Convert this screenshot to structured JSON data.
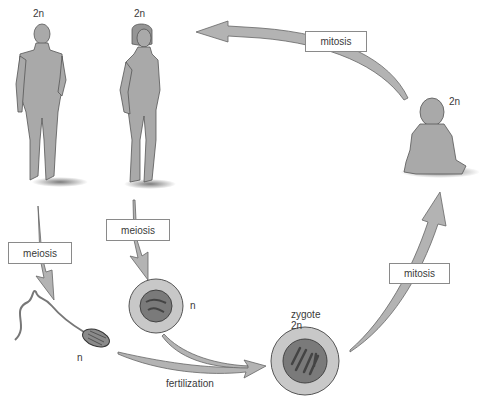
{
  "diagram": {
    "type": "human life cycle",
    "colors": {
      "figure_fill": "#a9a9a9",
      "arrow_fill": "#b3b3b3",
      "outline": "#555555",
      "nucleus": "#707070",
      "label_text": "#3a3a3a",
      "background": "#ffffff"
    },
    "nodes": {
      "male": {
        "label": "2n",
        "description": "adult male"
      },
      "female": {
        "label": "2n",
        "description": "adult female"
      },
      "baby": {
        "label": "2n",
        "description": "infant"
      },
      "sperm": {
        "label": "n",
        "description": "sperm cell"
      },
      "egg": {
        "label": "n",
        "description": "egg cell"
      },
      "zygote": {
        "label_line1": "zygote",
        "label_line2": "2n"
      }
    },
    "processes": {
      "mitosis_top": "mitosis",
      "mitosis_right": "mitosis",
      "meiosis_male": "meiosis",
      "meiosis_female": "meiosis",
      "fertilization": "fertilization"
    },
    "edges": [
      {
        "from": "male",
        "to": "sperm",
        "label": "meiosis"
      },
      {
        "from": "female",
        "to": "egg",
        "label": "meiosis"
      },
      {
        "from": "sperm",
        "to": "zygote",
        "label": "fertilization"
      },
      {
        "from": "egg",
        "to": "zygote",
        "label": "fertilization"
      },
      {
        "from": "zygote",
        "to": "baby",
        "label": "mitosis"
      },
      {
        "from": "baby",
        "to": "female",
        "label": "mitosis"
      }
    ]
  }
}
